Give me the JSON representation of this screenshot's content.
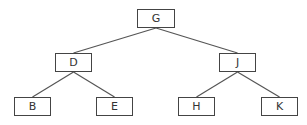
{
  "diagram": {
    "type": "binary-tree",
    "line_color": "#555555",
    "border_color": "#444444",
    "nodes": [
      {
        "id": "G",
        "label": "G",
        "x": 137,
        "y": 9,
        "w": 38,
        "h": 19
      },
      {
        "id": "D",
        "label": "D",
        "x": 55,
        "y": 53,
        "w": 37,
        "h": 19
      },
      {
        "id": "J",
        "label": "J",
        "x": 219,
        "y": 53,
        "w": 37,
        "h": 19
      },
      {
        "id": "B",
        "label": "B",
        "x": 14,
        "y": 97,
        "w": 37,
        "h": 19
      },
      {
        "id": "E",
        "label": "E",
        "x": 96,
        "y": 97,
        "w": 37,
        "h": 19
      },
      {
        "id": "H",
        "label": "H",
        "x": 178,
        "y": 97,
        "w": 37,
        "h": 19
      },
      {
        "id": "K",
        "label": "K",
        "x": 261,
        "y": 97,
        "w": 37,
        "h": 19
      }
    ],
    "edges": [
      {
        "from": "G",
        "to": "D"
      },
      {
        "from": "G",
        "to": "J"
      },
      {
        "from": "D",
        "to": "B"
      },
      {
        "from": "D",
        "to": "E"
      },
      {
        "from": "J",
        "to": "H"
      },
      {
        "from": "J",
        "to": "K"
      }
    ]
  }
}
